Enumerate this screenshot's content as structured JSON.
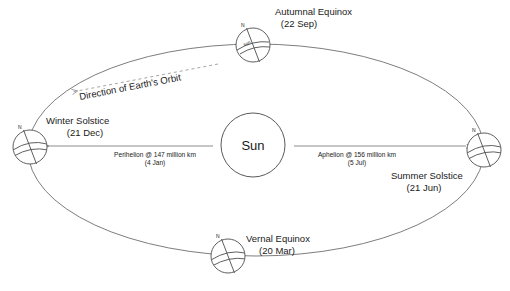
{
  "diagram": {
    "center_body": {
      "name": "sun-label",
      "label": "Sun"
    },
    "orbit": {
      "direction_label": "Direction of Earth's Orbit",
      "shape": "ellipse"
    },
    "positions": [
      {
        "key": "autumnal-equinox",
        "title": "Autumnal Equinox",
        "date": "(22 Sep)",
        "pole_label": "N",
        "globe_word": "sun"
      },
      {
        "key": "winter-solstice",
        "title": "Winter Solstice",
        "date": "(21 Dec)",
        "pole_label": "N",
        "globe_word": ""
      },
      {
        "key": "vernal-equinox",
        "title": "Vernal Equinox",
        "date": "(20 Mar)",
        "pole_label": "N",
        "globe_word": ""
      },
      {
        "key": "summer-solstice",
        "title": "Summer Solstice",
        "date": "(21 Jun)",
        "pole_label": "N",
        "globe_word": ""
      }
    ],
    "distances": [
      {
        "key": "perihelion",
        "line1": "Perihelion @ 147 million km",
        "line2": "(4 Jan)",
        "arrow_direction": "left"
      },
      {
        "key": "aphelion",
        "line1": "Aphelion @ 156 million km",
        "line2": "(5 Jul)",
        "arrow_direction": "right"
      }
    ],
    "colors": {
      "background": "#ffffff",
      "stroke": "#6e6e6e",
      "text": "#1a1a1a",
      "dashed": "#9a9a9a"
    }
  }
}
